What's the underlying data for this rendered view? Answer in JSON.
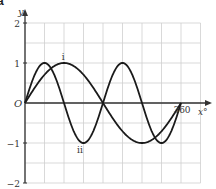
{
  "part_label": "a",
  "chart_data": {
    "type": "line",
    "title": "",
    "xlabel": "x°",
    "ylabel": "y",
    "origin_label": "O",
    "xlim": [
      0,
      405
    ],
    "ylim": [
      -2,
      2
    ],
    "x_grid_step": 45,
    "y_grid_step": 0.5,
    "grid": true,
    "x_tick_labels": [
      {
        "value": 360,
        "label": "360"
      }
    ],
    "y_tick_labels": [
      {
        "value": 2,
        "label": "2"
      },
      {
        "value": 1,
        "label": "1"
      },
      {
        "value": -1,
        "label": "−1"
      },
      {
        "value": -2,
        "label": "−2"
      }
    ],
    "x": [
      0,
      45,
      90,
      135,
      180,
      225,
      270,
      315,
      360
    ],
    "series": [
      {
        "name": "i",
        "expression": "y = sin x",
        "values": [
          0,
          0.707,
          1,
          0.707,
          0,
          -0.707,
          -1,
          -0.707,
          0
        ],
        "label_at": [
          85,
          1.0
        ]
      },
      {
        "name": "ii",
        "expression": "y = sin 2x",
        "values": [
          0,
          1,
          0,
          -1,
          0,
          1,
          0,
          -1,
          0
        ],
        "label_at": [
          120,
          -1.1
        ]
      }
    ]
  }
}
